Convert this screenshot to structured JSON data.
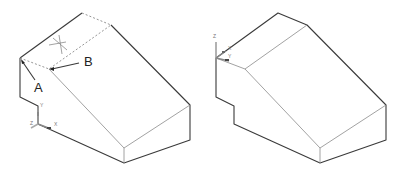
{
  "figures": [
    {
      "id": "left",
      "description": "Isometric wedge block with hidden top face, points A and B marked",
      "labels": [
        {
          "text": "A",
          "x": 34,
          "y": 90
        },
        {
          "text": "B",
          "x": 84,
          "y": 66
        }
      ],
      "ucs": {
        "x_label": "X",
        "y_label": "Y",
        "z_label": "Z"
      }
    },
    {
      "id": "right",
      "description": "Same wedge block with UCS moved to top-front corner",
      "ucs": {
        "x_label": "X",
        "y_label": "Y",
        "z_label": "Z"
      }
    }
  ],
  "colors": {
    "edge": "#3a3a3a",
    "hidden": "#8a8a8a",
    "background": "#ffffff"
  }
}
